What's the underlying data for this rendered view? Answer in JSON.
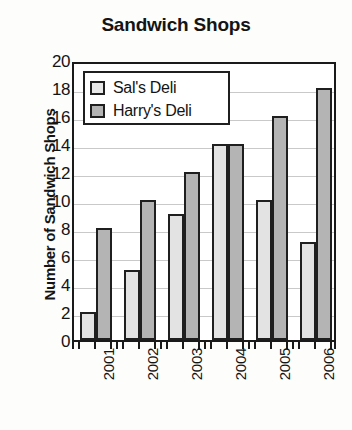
{
  "chart_data": {
    "type": "bar",
    "title": "Sandwich Shops",
    "xlabel": "",
    "ylabel": "Number of Sandwich Shops",
    "categories": [
      "2001",
      "2002",
      "2003",
      "2004",
      "2005",
      "2006"
    ],
    "series": [
      {
        "name": "Sal's Deli",
        "values": [
          2,
          5,
          9,
          14,
          10,
          7
        ],
        "color": "#e3e3e3"
      },
      {
        "name": "Harry's Deli",
        "values": [
          8,
          10,
          12,
          14,
          16,
          18
        ],
        "color": "#b4b4b4"
      }
    ],
    "ylim": [
      0,
      20
    ],
    "ytick_step": 2,
    "yticks": [
      "20",
      "18",
      "16",
      "14",
      "12",
      "10",
      "8",
      "6",
      "4",
      "2",
      "0"
    ],
    "grid": true,
    "grid_axis": "y",
    "legend_position": "top-left-inside",
    "xtick_rotation": -90,
    "border_color": "#1f1f1f"
  }
}
